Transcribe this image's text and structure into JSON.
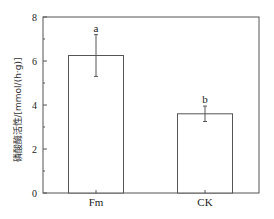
{
  "chart_data": {
    "type": "bar",
    "title": "",
    "xlabel": "",
    "ylabel": "磷酸酶活性/[mmol/(h·g)]",
    "categories": [
      "Fm",
      "CK"
    ],
    "values": [
      6.25,
      3.6
    ],
    "errors": [
      0.95,
      0.35
    ],
    "significance_letters": [
      "a",
      "b"
    ],
    "ylim": [
      0,
      8
    ],
    "yticks": [
      0,
      2,
      4,
      6,
      8
    ],
    "grid": false,
    "legend": null
  }
}
